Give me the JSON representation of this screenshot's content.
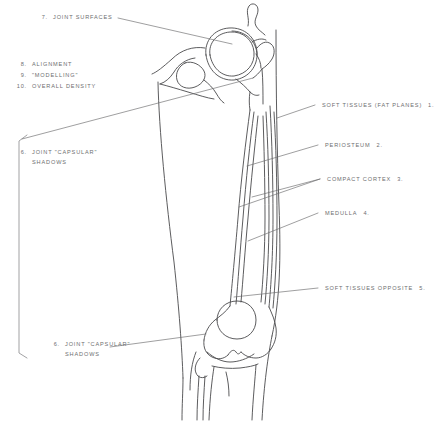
{
  "figure": {
    "ink_color": "#4a4a4c",
    "text_color": "#6e6e70",
    "background": "#ffffff"
  },
  "annotations": {
    "top_left": {
      "number": "7.",
      "label": "JOINT SURFACES"
    },
    "checklist": [
      {
        "number": "8.",
        "label": "ALIGNMENT"
      },
      {
        "number": "9.",
        "label": "\"MODELLING\""
      },
      {
        "number": "10.",
        "label": "OVERALL DENSITY"
      }
    ],
    "left_bracket": {
      "number": "6.",
      "label_line1": "JOINT \"CAPSULAR\"",
      "label_line2": "SHADOWS"
    },
    "bottom_left": {
      "number": "6.",
      "label_line1": "JOINT \"CAPSULAR\"",
      "label_line2": "SHADOWS"
    },
    "right": [
      {
        "number": "1.",
        "label": "SOFT TISSUES (FAT PLANES)"
      },
      {
        "number": "2.",
        "label": "PERIOSTEUM"
      },
      {
        "number": "3.",
        "label": "COMPACT CORTEX"
      },
      {
        "number": "4.",
        "label": "MEDULLA"
      },
      {
        "number": "5.",
        "label": "SOFT TISSUES OPPOSITE"
      }
    ]
  },
  "anatomy_parts": [
    "acetabulum",
    "femoral-head",
    "femoral-neck",
    "greater-trochanter",
    "lesser-trochanter",
    "femoral-shaft",
    "cortex",
    "medullary-canal",
    "femoral-condyles",
    "patella",
    "tibial-plateau",
    "fibula-head",
    "soft-tissue-outline"
  ]
}
